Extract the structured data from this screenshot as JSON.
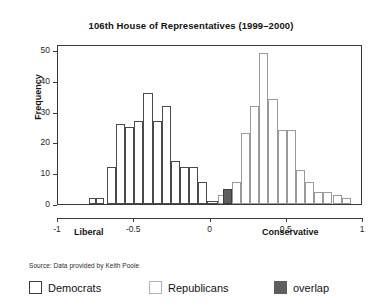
{
  "chart_data": {
    "type": "bar",
    "title": "106th House of Representatives (1999–2000)",
    "xlabel": "",
    "ylabel": "Frequency",
    "xlim": [
      -1,
      1
    ],
    "ylim": [
      0,
      52
    ],
    "bin_width": 0.05,
    "grid": false,
    "legend_position": "below-plot",
    "x_ticks": [
      "-1",
      "-0.5",
      "0",
      "0.5",
      "1"
    ],
    "x_tick_values": [
      -1,
      -0.5,
      0,
      0.5,
      1
    ],
    "y_ticks": [
      "0",
      "10",
      "20",
      "30",
      "40",
      "50"
    ],
    "y_tick_values": [
      0,
      10,
      20,
      30,
      40,
      50
    ],
    "axis_end_labels": {
      "left": "Liberal",
      "right": "Conservative"
    },
    "source": "Source: Data provided by Keith Poole",
    "legend": [
      {
        "key": "democrats",
        "label": "Democrats",
        "fill": "#ffffff",
        "border": "#3c3c3c"
      },
      {
        "key": "republicans",
        "label": "Republicans",
        "fill": "#ffffff",
        "border": "#b4b4b4"
      },
      {
        "key": "overlap",
        "label": "overlap",
        "fill": "#5e5e5e",
        "border": "#5e5e5e"
      }
    ],
    "series": [
      {
        "name": "Democrats",
        "bins": [
          -0.8,
          -0.75,
          -0.7,
          -0.65,
          -0.6,
          -0.55,
          -0.5,
          -0.45,
          -0.4,
          -0.35,
          -0.3,
          -0.25,
          -0.2,
          -0.15,
          -0.1,
          -0.05,
          0.0
        ],
        "values": [
          2,
          2,
          0,
          12,
          26,
          25,
          27,
          36,
          0,
          27,
          32,
          14,
          12,
          12,
          7,
          1,
          0
        ]
      },
      {
        "name": "Republicans",
        "bins": [
          0.0,
          0.05,
          0.1,
          0.15,
          0.2,
          0.25,
          0.3,
          0.35,
          0.4,
          0.45,
          0.5,
          0.55,
          0.6,
          0.65,
          0.7,
          0.75,
          0.8,
          0.85,
          0.9
        ],
        "values": [
          0,
          2,
          5,
          7,
          0,
          23,
          32,
          49,
          34,
          24,
          24,
          0,
          11,
          7,
          4,
          0,
          3,
          2,
          0
        ]
      },
      {
        "name": "overlap",
        "bins": [
          0.1
        ],
        "values": [
          5
        ]
      }
    ],
    "bars_drawn": [
      {
        "x0": -0.8,
        "x1": -0.75,
        "value": 2,
        "group": "democrats"
      },
      {
        "x0": -0.75,
        "x1": -0.7,
        "value": 2,
        "group": "democrats"
      },
      {
        "x0": -0.68,
        "x1": -0.62,
        "value": 12,
        "group": "democrats"
      },
      {
        "x0": -0.62,
        "x1": -0.56,
        "value": 26,
        "group": "democrats"
      },
      {
        "x0": -0.56,
        "x1": -0.5,
        "value": 25,
        "group": "democrats"
      },
      {
        "x0": -0.5,
        "x1": -0.44,
        "value": 27,
        "group": "democrats"
      },
      {
        "x0": -0.44,
        "x1": -0.38,
        "value": 36,
        "group": "democrats"
      },
      {
        "x0": -0.38,
        "x1": -0.32,
        "value": 27,
        "group": "democrats"
      },
      {
        "x0": -0.32,
        "x1": -0.26,
        "value": 32,
        "group": "democrats"
      },
      {
        "x0": -0.26,
        "x1": -0.2,
        "value": 14,
        "group": "democrats"
      },
      {
        "x0": -0.2,
        "x1": -0.14,
        "value": 12,
        "group": "democrats"
      },
      {
        "x0": -0.14,
        "x1": -0.08,
        "value": 12,
        "group": "democrats"
      },
      {
        "x0": -0.08,
        "x1": -0.02,
        "value": 7,
        "group": "democrats"
      },
      {
        "x0": -0.02,
        "x1": 0.05,
        "value": 1,
        "group": "democrats"
      },
      {
        "x0": 0.05,
        "x1": 0.1,
        "value": 3,
        "group": "republicans"
      },
      {
        "x0": 0.08,
        "x1": 0.14,
        "value": 5,
        "group": "overlap"
      },
      {
        "x0": 0.14,
        "x1": 0.2,
        "value": 7,
        "group": "republicans"
      },
      {
        "x0": 0.2,
        "x1": 0.26,
        "value": 23,
        "group": "republicans"
      },
      {
        "x0": 0.26,
        "x1": 0.32,
        "value": 32,
        "group": "republicans"
      },
      {
        "x0": 0.32,
        "x1": 0.38,
        "value": 49,
        "group": "republicans"
      },
      {
        "x0": 0.38,
        "x1": 0.44,
        "value": 34,
        "group": "republicans"
      },
      {
        "x0": 0.44,
        "x1": 0.5,
        "value": 24,
        "group": "republicans"
      },
      {
        "x0": 0.5,
        "x1": 0.56,
        "value": 24,
        "group": "republicans"
      },
      {
        "x0": 0.56,
        "x1": 0.62,
        "value": 11,
        "group": "republicans"
      },
      {
        "x0": 0.62,
        "x1": 0.68,
        "value": 7,
        "group": "republicans"
      },
      {
        "x0": 0.68,
        "x1": 0.74,
        "value": 4,
        "group": "republicans"
      },
      {
        "x0": 0.74,
        "x1": 0.8,
        "value": 4,
        "group": "republicans"
      },
      {
        "x0": 0.8,
        "x1": 0.86,
        "value": 3,
        "group": "republicans"
      },
      {
        "x0": 0.86,
        "x1": 0.92,
        "value": 2,
        "group": "republicans"
      }
    ]
  }
}
